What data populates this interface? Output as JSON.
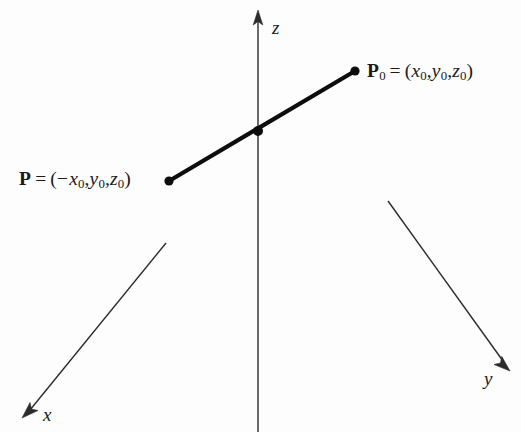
{
  "figure": {
    "type": "3d-coordinate-axes-diagram",
    "background_color": "#fdfdfd",
    "ink_color": "#1a1a1a",
    "width": 521,
    "height": 432
  },
  "axes": {
    "origin": {
      "x": 258,
      "y": 277
    },
    "z": {
      "label": "z",
      "label_pos": {
        "x": 272,
        "y": 18
      },
      "from": {
        "x": 258,
        "y": 432
      },
      "to": {
        "x": 258,
        "y": 12
      },
      "arrow": "up"
    },
    "y": {
      "label": "y",
      "label_pos": {
        "x": 484,
        "y": 369
      },
      "from": {
        "x": 388,
        "y": 201
      },
      "to": {
        "x": 508,
        "y": 368
      },
      "arrow": "down-right"
    },
    "x": {
      "label": "x",
      "label_pos": {
        "x": 43,
        "y": 405
      },
      "from": {
        "x": 166,
        "y": 243
      },
      "to": {
        "x": 24,
        "y": 415
      },
      "arrow": "down-left"
    }
  },
  "segment": {
    "start": {
      "x": 169,
      "y": 181
    },
    "mid": {
      "x": 258,
      "y": 131
    },
    "end": {
      "x": 355,
      "y": 71
    },
    "stroke_width": 4.2,
    "color": "#0d0d0d"
  },
  "points": [
    {
      "name": "P0",
      "dot": {
        "x": 355,
        "y": 71
      },
      "label_parts": {
        "symbol": "P",
        "symbol_sub": "0",
        "equals": "=",
        "open_paren": "(",
        "coord1": "x",
        "coord1_sub": "0",
        "comma1": ",",
        "coord2": "y",
        "coord2_sub": "0",
        "comma2": ",",
        "coord3": "z",
        "coord3_sub": "0",
        "close_paren": ")",
        "minus": ""
      },
      "label_text": "P0 = (x0,y0,z0)"
    },
    {
      "name": "P",
      "dot": {
        "x": 169,
        "y": 181
      },
      "label_parts": {
        "symbol": "P",
        "symbol_sub": "",
        "equals": "=",
        "open_paren": "(",
        "minus": "−",
        "coord1": "x",
        "coord1_sub": "0",
        "comma1": ",",
        "coord2": "y",
        "coord2_sub": "0",
        "comma2": ",",
        "coord3": "z",
        "coord3_sub": "0",
        "close_paren": ")"
      },
      "label_text": "P = (-x0,y0,z0)"
    },
    {
      "name": "midpoint-on-z-axis",
      "dot": {
        "x": 258,
        "y": 131
      },
      "label_text": ""
    }
  ]
}
